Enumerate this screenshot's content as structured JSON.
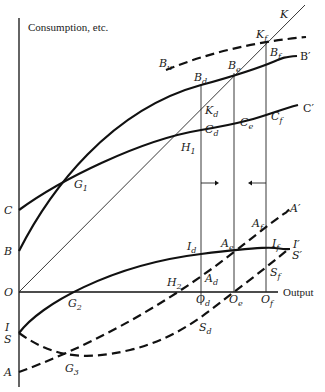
{
  "figure": {
    "y_axis_label": "Consumption, etc.",
    "x_axis_label": "Output",
    "origin_label": "O"
  },
  "curves": {
    "K": {
      "label": "K",
      "style": "thin-solid"
    },
    "B": {
      "start": "B",
      "end": "B′",
      "style": "thick-solid"
    },
    "C": {
      "start": "C",
      "end": "C′",
      "style": "thick-solid"
    },
    "Bu": {
      "label": "B",
      "sub": "u",
      "style": "thick-dashed"
    },
    "I": {
      "start": "I",
      "end": "I′",
      "style": "thick-solid"
    },
    "A": {
      "start": "A",
      "end": "A′",
      "style": "thick-dashed"
    },
    "S": {
      "start": "S",
      "end": "S′",
      "style": "thick-dashed"
    }
  },
  "axis_labels": {
    "C": "C",
    "B": "B",
    "O": "O",
    "I": "I",
    "S": "S",
    "A": "A"
  },
  "points": {
    "G1": {
      "base": "G",
      "sub": "1"
    },
    "G2": {
      "base": "G",
      "sub": "2"
    },
    "G3": {
      "base": "G",
      "sub": "3"
    },
    "H1": {
      "base": "H",
      "sub": "1"
    },
    "H2": {
      "base": "H",
      "sub": "2"
    },
    "Kd": {
      "base": "K",
      "sub": "d"
    },
    "Kf": {
      "base": "K",
      "sub": "f"
    },
    "Bd": {
      "base": "B",
      "sub": "d"
    },
    "Be": {
      "base": "B",
      "sub": "e"
    },
    "Bf": {
      "base": "B",
      "sub": "f"
    },
    "Cd": {
      "base": "C",
      "sub": "d"
    },
    "Ce": {
      "base": "C",
      "sub": "e"
    },
    "Cf": {
      "base": "C",
      "sub": "f"
    },
    "Id": {
      "base": "I",
      "sub": "d"
    },
    "If": {
      "base": "I",
      "sub": "f"
    },
    "Ad": {
      "base": "A",
      "sub": "d"
    },
    "Ae": {
      "base": "A",
      "sub": "e"
    },
    "Af": {
      "base": "A",
      "sub": "f"
    },
    "Sd": {
      "base": "S",
      "sub": "d"
    },
    "Sf": {
      "base": "S",
      "sub": "f"
    },
    "Od": {
      "base": "O",
      "sub": "d"
    },
    "Oe": {
      "base": "O",
      "sub": "e"
    },
    "Of": {
      "base": "O",
      "sub": "f"
    }
  },
  "end_labels": {
    "K": "K",
    "B_prime": "B′",
    "C_prime": "C′",
    "I_prime": "I′",
    "S_prime": "S′",
    "A_prime": "A′"
  },
  "arrows": [
    {
      "at": "x=Od",
      "direction": "right"
    },
    {
      "at": "x=Of",
      "direction": "left"
    }
  ]
}
